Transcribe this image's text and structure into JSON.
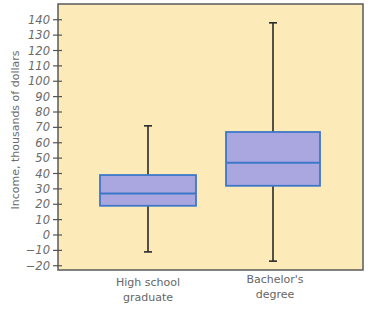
{
  "chart_data": {
    "type": "boxplot",
    "title": "",
    "xlabel": "",
    "ylabel": "Income, thousands of dollars",
    "ylim": [
      -20,
      140
    ],
    "yticks": [
      -20,
      -10,
      0,
      10,
      20,
      30,
      40,
      50,
      60,
      70,
      80,
      90,
      100,
      110,
      120,
      130,
      140
    ],
    "grid": false,
    "categories": [
      "High school graduate",
      "Bachelor's degree"
    ],
    "category_label_lines": [
      [
        "High school",
        "graduate"
      ],
      [
        "Bachelor's",
        "degree"
      ]
    ],
    "series": [
      {
        "name": "High school graduate",
        "whisker_low": -11,
        "q1": 19,
        "median": 27,
        "q3": 39,
        "whisker_high": 71
      },
      {
        "name": "Bachelor's degree",
        "whisker_low": -17,
        "q1": 32,
        "median": 47,
        "q3": 67,
        "whisker_high": 138
      }
    ]
  },
  "colors": {
    "plot_background": "#fcebb8",
    "box_fill": "#aaa6e0",
    "box_stroke": "#3d78c8",
    "whisker": "#2a2a2a",
    "axis": "#555555",
    "text": "#6b6b6b"
  }
}
